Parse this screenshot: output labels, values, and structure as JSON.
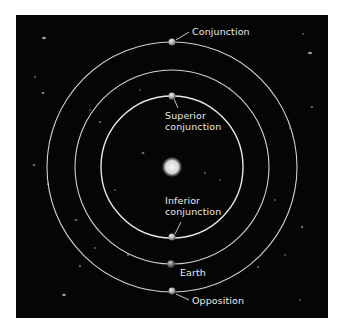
{
  "diagram": {
    "background_color": "#050505",
    "orbit_color": "#d8d8d8",
    "text_color": "#e8e8e8",
    "center": {
      "name": "Sun",
      "x": 172,
      "y": 167,
      "r": 9
    },
    "orbits": [
      {
        "name": "inner-planet-orbit",
        "r": 71
      },
      {
        "name": "earth-orbit",
        "r": 97
      },
      {
        "name": "outer-planet-orbit",
        "r": 125
      }
    ],
    "bodies": [
      {
        "name": "outer-planet-conjunction",
        "x": 172,
        "y": 42
      },
      {
        "name": "inner-planet-superior-conjunction",
        "x": 172,
        "y": 96
      },
      {
        "name": "inner-planet-inferior-conjunction",
        "x": 172,
        "y": 237
      },
      {
        "name": "earth",
        "x": 171,
        "y": 264
      },
      {
        "name": "outer-planet-opposition",
        "x": 172,
        "y": 291
      }
    ],
    "labels": {
      "conjunction": "Conjunction",
      "superior_line1": "Superior",
      "superior_line2": "conjunction",
      "inferior_line1": "Inferior",
      "inferior_line2": "conjunction",
      "earth": "Earth",
      "opposition": "Opposition"
    }
  }
}
